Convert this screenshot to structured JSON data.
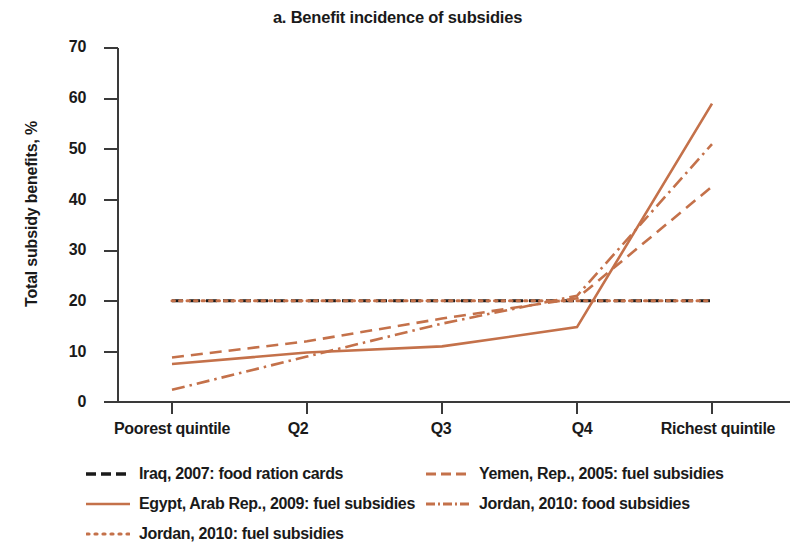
{
  "chart_data": {
    "type": "line",
    "title": "a. Benefit incidence of subsidies",
    "xlabel": "",
    "ylabel": "Total subsidy benefits, %",
    "categories": [
      "Poorest quintile",
      "Q2",
      "Q3",
      "Q4",
      "Richest quintile"
    ],
    "ylim": [
      0,
      70
    ],
    "yticks": [
      0,
      10,
      20,
      30,
      40,
      50,
      60,
      70
    ],
    "ytick_labels": [
      "0",
      "10",
      "20",
      "30",
      "40",
      "50",
      "60",
      "70"
    ],
    "grid": false,
    "legend_position": "bottom",
    "series": [
      {
        "name": "Iraq, 2007: food ration cards",
        "values": [
          20,
          20,
          20,
          20,
          20
        ],
        "color": "#1a1a1a",
        "style": "dashed"
      },
      {
        "name": "Yemen, Rep., 2005: fuel subsidies",
        "values": [
          8.8,
          12.0,
          16.5,
          20.5,
          42.6
        ],
        "color": "#c4714a",
        "style": "dashed"
      },
      {
        "name": "Egypt, Arab Rep., 2009: fuel subsidies",
        "values": [
          7.5,
          9.8,
          11.0,
          14.8,
          59.0
        ],
        "color": "#c4714a",
        "style": "solid"
      },
      {
        "name": "Jordan, 2010: food subsidies",
        "values": [
          2.4,
          9.0,
          15.5,
          21.0,
          51.0
        ],
        "color": "#c4714a",
        "style": "dashdot"
      },
      {
        "name": "Jordan, 2010: fuel subsidies",
        "values": [
          20,
          20,
          20,
          20,
          20
        ],
        "color": "#c4714a",
        "style": "dotted"
      }
    ]
  },
  "legend": {
    "rows": [
      {
        "a": {
          "label": "Iraq, 2007: food ration cards",
          "icon": "dashed-line-swatch"
        },
        "b": {
          "label": "Yemen, Rep., 2005: fuel subsidies",
          "icon": "dashed-line-swatch"
        }
      },
      {
        "a": {
          "label": "Egypt, Arab Rep., 2009: fuel subsidies",
          "icon": "solid-line-swatch"
        },
        "b": {
          "label": "Jordan, 2010: food subsidies",
          "icon": "dashdot-line-swatch"
        }
      },
      {
        "a": {
          "label": "Jordan, 2010: fuel subsidies",
          "icon": "dotted-line-swatch"
        },
        "b": {
          "label": "",
          "icon": ""
        }
      }
    ]
  },
  "colors": {
    "accent": "#c4714a",
    "axis": "#3a3a3a",
    "text": "#1a1a1a"
  }
}
